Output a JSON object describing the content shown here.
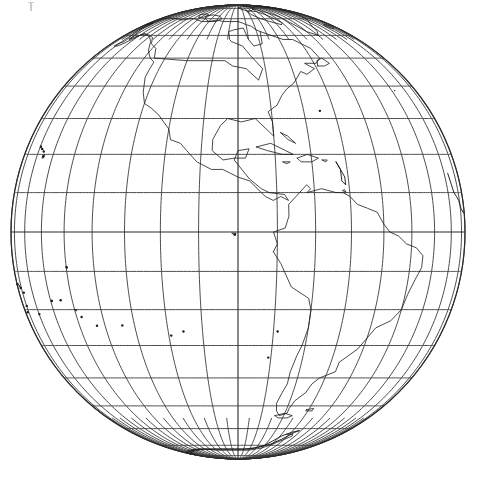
{
  "figure": {
    "projection": "orthographic",
    "center_lon": -90,
    "center_lat": 0,
    "radius_px": 227,
    "center_px": [
      238,
      232
    ],
    "background_color": "#ffffff",
    "line_color": "#2a2a2a",
    "coast_color": "#1a1a1a"
  },
  "graticule": {
    "meridian_step_deg": 10,
    "parallel_step_deg": 10,
    "meridians_deg": [
      -180,
      -170,
      -160,
      -150,
      -140,
      -130,
      -120,
      -110,
      -100,
      -90,
      -80,
      -70,
      -60,
      -50,
      -40,
      -30,
      -20,
      -10,
      0
    ],
    "parallels_deg": [
      -80,
      -70,
      -60,
      -50,
      -40,
      -30,
      -20,
      -10,
      0,
      10,
      20,
      30,
      40,
      50,
      60,
      70,
      80
    ],
    "equator_deg": 0,
    "central_meridian_deg": -90,
    "pole_north_visible": true,
    "pole_south_visible": true
  },
  "features": {
    "limb_label": "globe-limb",
    "regions": [
      "North America",
      "Greenland",
      "Canadian Arctic Archipelago",
      "Central America",
      "Caribbean Islands",
      "South America",
      "Antarctic Peninsula",
      "Hawaiian Islands",
      "New Zealand",
      "Pacific Islands"
    ]
  },
  "artifact": {
    "name": "scan-mark",
    "position_px": [
      28,
      2
    ]
  }
}
